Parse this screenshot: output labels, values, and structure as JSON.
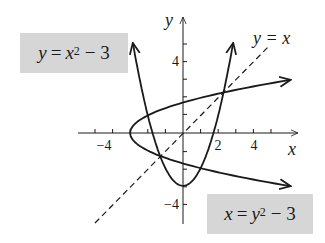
{
  "chart_data": {
    "type": "line",
    "title": "",
    "xlabel": "x",
    "ylabel": "y",
    "xlim": [
      -5,
      6
    ],
    "ylim": [
      -5,
      6
    ],
    "grid": false,
    "x_ticks": [
      -4,
      2,
      4
    ],
    "x_tick_labels": [
      "−4",
      "2",
      "4"
    ],
    "y_ticks": [
      -4,
      4
    ],
    "y_tick_labels": [
      "−4",
      "4"
    ],
    "series": [
      {
        "name": "y = x^2 - 3",
        "style": "solid",
        "relation": "y = x^2 - 3",
        "x": [
          -2.85,
          -2,
          -1,
          0,
          1,
          2,
          2.85
        ],
        "y": [
          5.12,
          1,
          -2,
          -3,
          -2,
          1,
          5.12
        ]
      },
      {
        "name": "x = y^2 - 3",
        "style": "solid",
        "relation": "x = y^2 - 3",
        "x": [
          6.1,
          1,
          -2,
          -3,
          -2,
          1,
          6.1
        ],
        "y": [
          3.02,
          2,
          1,
          0,
          -1,
          -2,
          -3.02
        ]
      },
      {
        "name": "y = x",
        "style": "dashed",
        "relation": "y = x",
        "x": [
          -5,
          4.9
        ],
        "y": [
          -5,
          4.9
        ]
      }
    ],
    "annotations": [
      {
        "text": "y = x^2 - 3",
        "boxed": true,
        "position": "upper-left"
      },
      {
        "text": "x = y^2 - 3",
        "boxed": true,
        "position": "lower-right"
      },
      {
        "text": "y = x",
        "boxed": false,
        "position": "upper-right"
      }
    ]
  },
  "labels": {
    "parabola_lhs": "y",
    "parabola_eq": "=",
    "parabola_var": "x",
    "parabola_exp": "2",
    "parabola_rest": "− 3",
    "sideways_lhs": "x",
    "sideways_eq": "=",
    "sideways_var": "y",
    "sideways_exp": "2",
    "sideways_rest": "− 3",
    "diagonal": "y = x",
    "x_axis": "x",
    "y_axis": "y",
    "tick_x_neg4": "−4",
    "tick_x_2": "2",
    "tick_x_4": "4",
    "tick_y_4": "4",
    "tick_y_neg4": "−4"
  },
  "colors": {
    "curve": "#1a1a1a",
    "label_box": "#d6d6d6",
    "background": "#ffffff"
  }
}
